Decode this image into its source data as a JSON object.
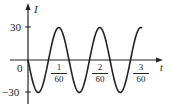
{
  "chart_data": {
    "type": "line",
    "title": "",
    "xlabel": "t",
    "ylabel": "I",
    "function": "I = -30 sin(120πt)",
    "amplitude": 30,
    "period": 0.016666666666666666,
    "x_ticks": [
      "1/60",
      "2/60",
      "3/60"
    ],
    "y_ticks": [
      "30",
      "0",
      "-30"
    ],
    "xlim": [
      0,
      0.05
    ],
    "ylim": [
      -30,
      30
    ],
    "grid": false,
    "series": [
      {
        "name": "I(t)",
        "x": [
          0,
          0.00417,
          0.00833,
          0.0125,
          0.01667,
          0.02083,
          0.025,
          0.02917,
          0.03333,
          0.0375,
          0.04167,
          0.04583,
          0.05
        ],
        "values": [
          0,
          -30,
          0,
          30,
          0,
          -30,
          0,
          30,
          0,
          -30,
          0,
          30,
          0
        ]
      }
    ]
  },
  "labels": {
    "y_axis": "I",
    "x_axis": "t",
    "y_top": "30",
    "origin": "0",
    "y_bottom": "−30",
    "tick1_num": "1",
    "tick1_den": "60",
    "tick2_num": "2",
    "tick2_den": "60",
    "tick3_num": "3",
    "tick3_den": "60"
  }
}
